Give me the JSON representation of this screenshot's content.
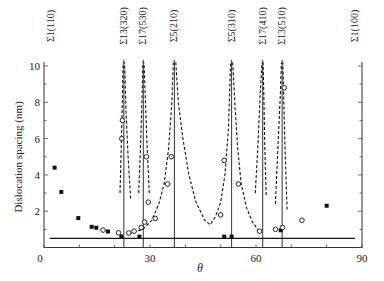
{
  "chart_data": {
    "type": "scatter",
    "title": "",
    "xlabel": "θ",
    "ylabel": "Dislocation spacing (nm)",
    "xlim": [
      0,
      90
    ],
    "ylim": [
      0,
      10
    ],
    "x_ticks": [
      0,
      30,
      60,
      90
    ],
    "y_ticks": [
      0,
      2,
      4,
      6,
      8,
      10
    ],
    "grid": false,
    "legend": null,
    "boundary_lines": [
      {
        "label": "Σ1(110)",
        "theta": 0
      },
      {
        "label": "Σ13(320)",
        "theta": 22.6
      },
      {
        "label": "Σ17(530)",
        "theta": 28.1
      },
      {
        "label": "Σ5(210)",
        "theta": 36.9
      },
      {
        "label": "Σ5(310)",
        "theta": 53.1
      },
      {
        "label": "Σ17(410)",
        "theta": 61.9
      },
      {
        "label": "Σ13(510)",
        "theta": 67.4
      },
      {
        "label": "Σ1(100)",
        "theta": 90
      }
    ],
    "series": [
      {
        "name": "filled squares",
        "marker": "square-filled",
        "x": [
          3.0,
          4.9,
          9.7,
          13.5,
          14.8,
          18.1,
          21.9,
          27.0,
          51.0,
          53.1,
          67.0,
          80.0
        ],
        "y": [
          4.4,
          3.06,
          1.62,
          1.14,
          1.09,
          0.88,
          0.61,
          0.6,
          0.6,
          0.6,
          0.95,
          2.3
        ]
      },
      {
        "name": "open circles",
        "marker": "circle-open",
        "x": [
          16.7,
          21.1,
          22.0,
          22.2,
          24.0,
          25.5,
          27.5,
          28.5,
          29.0,
          29.5,
          31.5,
          35.0,
          36.0,
          50.0,
          51.0,
          55.0,
          61.0,
          65.5,
          67.5,
          73.0,
          68.0
        ],
        "y": [
          0.96,
          0.81,
          6.0,
          7.0,
          0.8,
          0.9,
          1.1,
          1.4,
          5.0,
          2.5,
          1.6,
          3.5,
          5.0,
          1.8,
          4.8,
          3.5,
          0.9,
          1.0,
          1.1,
          1.5,
          8.8
        ]
      },
      {
        "name": "theory solid (Frank formula, low-angle from Σ1)",
        "line": "solid",
        "x": [
          1.5,
          3,
          5,
          10,
          15,
          20,
          30,
          40,
          50,
          60,
          70,
          75,
          80,
          85,
          88.5
        ],
        "y": [
          10,
          4.8,
          3.0,
          1.55,
          1.08,
          0.84,
          0.62,
          0.55,
          0.58,
          0.66,
          0.9,
          1.2,
          1.9,
          3.6,
          10
        ]
      },
      {
        "name": "theory dashed (secondary dislocations about CSL boundaries)",
        "line": "dashed"
      }
    ]
  }
}
